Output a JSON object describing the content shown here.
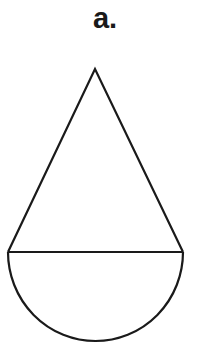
{
  "figure": {
    "label": "a.",
    "stroke_color": "#1a1a1a",
    "background": "#ffffff",
    "shapes": [
      {
        "type": "triangle",
        "points": [
          [
            95,
            69
          ],
          [
            8,
            252
          ],
          [
            183,
            252
          ]
        ]
      },
      {
        "type": "line",
        "from": [
          8,
          252
        ],
        "to": [
          183,
          252
        ]
      },
      {
        "type": "semicircle",
        "center": [
          95.5,
          252
        ],
        "radius": 87.5,
        "orientation": "down"
      }
    ]
  }
}
